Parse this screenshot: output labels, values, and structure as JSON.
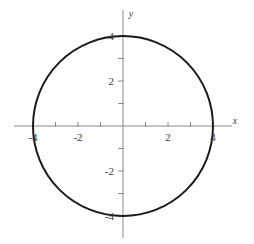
{
  "chart_data": {
    "type": "line",
    "title": "",
    "subtitle": "",
    "xlabel": "x",
    "ylabel": "y",
    "xlim": [
      -4.85,
      4.85
    ],
    "ylim": [
      -5.15,
      5.15
    ],
    "grid": false,
    "legend": null,
    "annotations": [],
    "axis_style": {
      "axes_through_origin": true,
      "tick_interval": 1,
      "tick_length": 4,
      "axis_color": "#8a8a8a",
      "curve_color": "#1a1a1a",
      "curve_width": 2,
      "background": "#ffffff"
    },
    "x_ticks": [
      -4,
      -3,
      -2,
      -1,
      1,
      2,
      3,
      4
    ],
    "y_ticks": [
      -4,
      -3,
      -2,
      -1,
      1,
      2,
      3,
      4
    ],
    "x_tick_labels": [
      {
        "value": -4,
        "text": "-4"
      },
      {
        "value": -2,
        "text": "-2"
      },
      {
        "value": 2,
        "text": "2"
      },
      {
        "value": 4,
        "text": "4"
      }
    ],
    "y_tick_labels": [
      {
        "value": 4,
        "text": "4"
      },
      {
        "value": 2,
        "text": "2"
      },
      {
        "value": -2,
        "text": "-2"
      },
      {
        "value": -4,
        "text": "-4"
      }
    ],
    "series": [
      {
        "name": "circle",
        "type": "circle",
        "equation": "x^2 + y^2 = 16",
        "center": [
          0,
          0
        ],
        "radius": 4,
        "color": "#1a1a1a",
        "linewidth": 2,
        "points": [
          [
            4,
            0
          ],
          [
            3.86,
            1.04
          ],
          [
            3.46,
            2
          ],
          [
            2.83,
            2.83
          ],
          [
            2,
            3.46
          ],
          [
            1.04,
            3.86
          ],
          [
            0,
            4
          ],
          [
            -1.04,
            3.86
          ],
          [
            -2,
            3.46
          ],
          [
            -2.83,
            2.83
          ],
          [
            -3.46,
            2
          ],
          [
            -3.86,
            1.04
          ],
          [
            -4,
            0
          ],
          [
            -3.86,
            -1.04
          ],
          [
            -3.46,
            -2
          ],
          [
            -2.83,
            -2.83
          ],
          [
            -2,
            -3.46
          ],
          [
            -1.04,
            -3.86
          ],
          [
            0,
            -4
          ],
          [
            1.04,
            -3.86
          ],
          [
            2,
            -3.46
          ],
          [
            2.83,
            -2.83
          ],
          [
            3.46,
            -2
          ],
          [
            3.86,
            -1.04
          ],
          [
            4,
            0
          ]
        ]
      }
    ],
    "axis_labels": {
      "x_axis_name": "x",
      "y_axis_name": "y"
    }
  }
}
